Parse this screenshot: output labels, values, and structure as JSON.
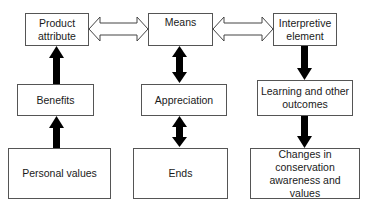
{
  "diagram": {
    "type": "flow",
    "columns": [
      {
        "name": "left",
        "nodes": [
          {
            "id": "product_attribute",
            "label": "Product attribute"
          },
          {
            "id": "benefits",
            "label": "Benefits"
          },
          {
            "id": "personal_values",
            "label": "Personal values"
          }
        ]
      },
      {
        "name": "middle",
        "nodes": [
          {
            "id": "means",
            "label": "Means"
          },
          {
            "id": "appreciation",
            "label": "Appreciation"
          },
          {
            "id": "ends",
            "label": "Ends"
          }
        ]
      },
      {
        "name": "right",
        "nodes": [
          {
            "id": "interpretive_element",
            "label": "Interpretive element"
          },
          {
            "id": "learning_outcomes",
            "label": "Learning and other outcomes"
          },
          {
            "id": "changes",
            "label": "Changes in conservation awareness and values"
          }
        ]
      }
    ],
    "edges": [
      {
        "from": "personal_values",
        "to": "benefits",
        "style": "solid-up"
      },
      {
        "from": "benefits",
        "to": "product_attribute",
        "style": "solid-up"
      },
      {
        "from": "means",
        "to": "appreciation",
        "style": "solid-bidirectional"
      },
      {
        "from": "appreciation",
        "to": "ends",
        "style": "solid-bidirectional"
      },
      {
        "from": "interpretive_element",
        "to": "learning_outcomes",
        "style": "solid-down"
      },
      {
        "from": "learning_outcomes",
        "to": "changes",
        "style": "solid-down"
      },
      {
        "from": "product_attribute",
        "to": "means",
        "style": "hollow-bidirectional"
      },
      {
        "from": "means",
        "to": "interpretive_element",
        "style": "hollow-bidirectional"
      }
    ],
    "colors": {
      "border": "#555555",
      "arrow_fill": "#000000",
      "background": "#ffffff"
    }
  }
}
